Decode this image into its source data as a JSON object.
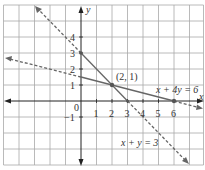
{
  "graph": {
    "x_axis_label": "x",
    "y_axis_label": "y",
    "origin_label": "0",
    "x_ticks": [
      {
        "label": "1",
        "value": 1
      },
      {
        "label": "2",
        "value": 2
      },
      {
        "label": "3",
        "value": 3
      },
      {
        "label": "4",
        "value": 4
      },
      {
        "label": "5",
        "value": 5
      },
      {
        "label": "6",
        "value": 6
      }
    ],
    "y_ticks": [
      {
        "label": "4",
        "value": 4
      },
      {
        "label": "3",
        "value": 3
      },
      {
        "label": "2",
        "value": 2
      },
      {
        "label": "1",
        "value": 1
      },
      {
        "label": "−1",
        "value": -1
      }
    ],
    "intersection_label": "(2, 1)",
    "line1_label": "x + 4y = 6",
    "line2_label": "x + y = 3",
    "colors": {
      "grid": "#9a9a9a",
      "axis": "#222222",
      "line": "#666666",
      "text": "#333333"
    }
  }
}
